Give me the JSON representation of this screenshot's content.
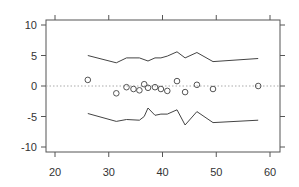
{
  "chart_data": {
    "type": "scatter",
    "title": "",
    "xlabel": "",
    "ylabel": "",
    "xlim": [
      18.3,
      61.8
    ],
    "ylim": [
      -10.8,
      10.8
    ],
    "x_ticks": [
      20,
      30,
      40,
      50,
      60
    ],
    "x_tick_labels": [
      "20",
      "30",
      "40",
      "50",
      "60"
    ],
    "y_ticks": [
      10,
      5,
      0,
      -5,
      -10
    ],
    "y_tick_labels": [
      "10",
      "5",
      "0",
      "-5",
      "-10"
    ],
    "grid": false,
    "legend": null,
    "reference_line": {
      "y": 0,
      "style": "dotted",
      "color": "#aaaaaa"
    },
    "series": [
      {
        "name": "points",
        "type": "scatter",
        "marker": "open-circle",
        "x": [
          26.1,
          31.4,
          33.3,
          34.6,
          35.7,
          36.6,
          37.3,
          38.6,
          39.7,
          40.9,
          42.7,
          44.2,
          46.4,
          49.4,
          57.8
        ],
        "y": [
          1.0,
          -1.2,
          -0.2,
          -0.5,
          -0.7,
          0.3,
          -0.3,
          -0.2,
          -0.5,
          -0.8,
          0.8,
          -1.0,
          0.2,
          -0.5,
          0.0
        ]
      },
      {
        "name": "upper-bound",
        "type": "line",
        "x": [
          26.1,
          31.4,
          33.3,
          35.7,
          37.3,
          38.6,
          39.7,
          40.9,
          42.7,
          44.2,
          46.4,
          49.4,
          57.8
        ],
        "y": [
          5.0,
          3.8,
          4.6,
          4.6,
          4.1,
          4.6,
          4.6,
          4.9,
          5.6,
          4.6,
          5.5,
          4.0,
          4.5
        ]
      },
      {
        "name": "lower-bound",
        "type": "line",
        "x": [
          26.1,
          31.4,
          33.3,
          35.7,
          36.6,
          37.3,
          38.6,
          39.7,
          40.9,
          42.7,
          44.2,
          46.4,
          49.4,
          57.8
        ],
        "y": [
          -4.5,
          -5.8,
          -5.5,
          -5.6,
          -5.0,
          -3.6,
          -4.8,
          -4.6,
          -4.6,
          -3.9,
          -6.4,
          -4.2,
          -6.0,
          -5.6
        ]
      }
    ]
  },
  "colors": {
    "axis": "#555555",
    "line": "#444444",
    "marker": "#555555",
    "reference": "#aaaaaa"
  }
}
